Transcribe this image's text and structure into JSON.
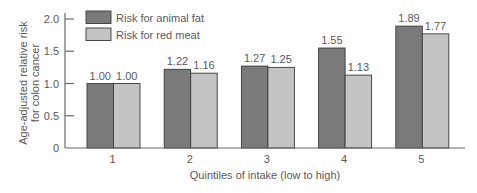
{
  "chart_data": {
    "type": "bar",
    "title": "",
    "xlabel": "Quintiles of intake (low to high)",
    "ylabel": "Age-adjusted relative risk for colon cancer",
    "ylabel_lines": [
      "Age-adjusted relative risk",
      "for colon cancer"
    ],
    "categories": [
      "1",
      "2",
      "3",
      "4",
      "5"
    ],
    "series": [
      {
        "name": "Risk for animal fat",
        "color": "#7a7a7a",
        "values": [
          1.0,
          1.22,
          1.27,
          1.55,
          1.89
        ],
        "labels": [
          "1.00",
          "1.22",
          "1.27",
          "1.55",
          "1.89"
        ]
      },
      {
        "name": "Risk for red meat",
        "color": "#c4c4c4",
        "values": [
          1.0,
          1.16,
          1.25,
          1.13,
          1.77
        ],
        "labels": [
          "1.00",
          "1.16",
          "1.25",
          "1.13",
          "1.77"
        ]
      }
    ],
    "ylim": [
      0,
      2.0
    ],
    "yticks": [
      0,
      0.5,
      1.0,
      1.5,
      2.0
    ],
    "ytick_labels": [
      "0",
      "0.5",
      "1.0",
      "1.5",
      "2.0"
    ],
    "grid": false,
    "legend_position": "top-left inside"
  },
  "colors": {
    "axis": "#6b6b6b",
    "bar_outline": "#3a3a3a",
    "text": "#5a5a5a"
  }
}
